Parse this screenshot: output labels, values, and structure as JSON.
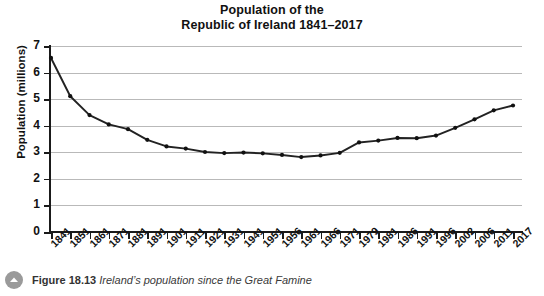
{
  "chart_data": {
    "type": "line",
    "title": "Population of the Republic of Ireland 1841–2017",
    "title_line1": "Population of the",
    "title_line2": "Republic of Ireland 1841–2017",
    "xlabel": "",
    "ylabel": "Population (millions)",
    "ylim": [
      0,
      7
    ],
    "yticks": [
      0,
      1,
      2,
      3,
      4,
      5,
      6,
      7
    ],
    "ytick_labels": [
      "0",
      "1",
      "2",
      "3",
      "4",
      "5",
      "6",
      "7"
    ],
    "grid": true,
    "grid_axis": "y",
    "legend": false,
    "marker": "filled-circle",
    "line_color": "#222222",
    "marker_color": "#111111",
    "categories": [
      "1841",
      "1851",
      "1861",
      "1871",
      "1881",
      "1891",
      "1901",
      "1911",
      "1921",
      "1931",
      "1941",
      "1951",
      "1956",
      "1961",
      "1966",
      "1971",
      "1979",
      "1981",
      "1986",
      "1991",
      "1996",
      "2002",
      "2006",
      "2011",
      "2017"
    ],
    "values": [
      6.55,
      5.11,
      4.4,
      4.05,
      3.87,
      3.47,
      3.22,
      3.14,
      3.01,
      2.97,
      2.99,
      2.96,
      2.9,
      2.82,
      2.88,
      2.98,
      3.37,
      3.44,
      3.54,
      3.53,
      3.63,
      3.92,
      4.24,
      4.58,
      4.76
    ],
    "series": [
      {
        "name": "Population of the Republic of Ireland",
        "unit": "millions",
        "points": [
          {
            "x": "1841",
            "y": 6.55
          },
          {
            "x": "1851",
            "y": 5.11
          },
          {
            "x": "1861",
            "y": 4.4
          },
          {
            "x": "1871",
            "y": 4.05
          },
          {
            "x": "1881",
            "y": 3.87
          },
          {
            "x": "1891",
            "y": 3.47
          },
          {
            "x": "1901",
            "y": 3.22
          },
          {
            "x": "1911",
            "y": 3.14
          },
          {
            "x": "1921",
            "y": 3.01
          },
          {
            "x": "1931",
            "y": 2.97
          },
          {
            "x": "1941",
            "y": 2.99
          },
          {
            "x": "1951",
            "y": 2.96
          },
          {
            "x": "1956",
            "y": 2.9
          },
          {
            "x": "1961",
            "y": 2.82
          },
          {
            "x": "1966",
            "y": 2.88
          },
          {
            "x": "1971",
            "y": 2.98
          },
          {
            "x": "1979",
            "y": 3.37
          },
          {
            "x": "1981",
            "y": 3.44
          },
          {
            "x": "1986",
            "y": 3.54
          },
          {
            "x": "1991",
            "y": 3.53
          },
          {
            "x": "1996",
            "y": 3.63
          },
          {
            "x": "2002",
            "y": 3.92
          },
          {
            "x": "2006",
            "y": 4.24
          },
          {
            "x": "2011",
            "y": 4.58
          },
          {
            "x": "2017",
            "y": 4.76
          }
        ]
      }
    ]
  },
  "caption": {
    "icon": "chevron-up-circle-icon",
    "figure_number": "Figure 18.13",
    "description": "Ireland’s population since the Great Famine"
  },
  "colors": {
    "line": "#222222",
    "grid": "#b9b9b9",
    "axis": "#1a1a1a",
    "caption_icon_bg": "#9a9a9a",
    "background": "#ffffff"
  }
}
